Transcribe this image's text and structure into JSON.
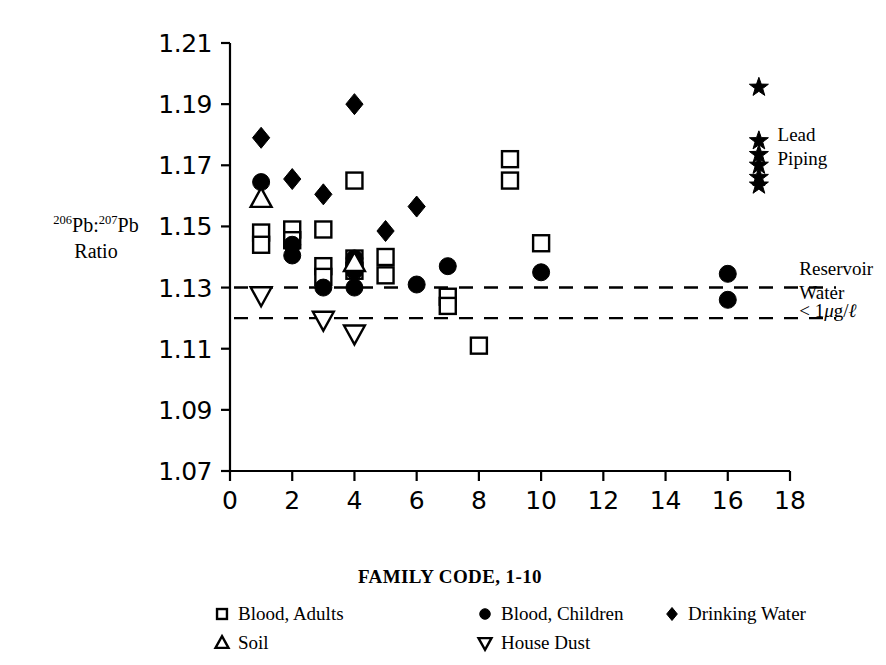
{
  "chart_data": {
    "type": "scatter",
    "title": "",
    "xlabel": "FAMILY CODE, 1-10",
    "ylabel": "206Pb:207Pb Ratio",
    "ylabel_parts": {
      "sup1": "206",
      "mid1": "Pb:",
      "sup2": "207",
      "mid2": "Pb",
      "line2": "Ratio"
    },
    "xlim": [
      0,
      18
    ],
    "ylim": [
      1.07,
      1.21
    ],
    "xticks": [
      0,
      2,
      4,
      6,
      8,
      10,
      12,
      14,
      16,
      18
    ],
    "xticklabels": [
      "0",
      "2",
      "4",
      "6",
      "8",
      "10",
      "12",
      "14",
      "16",
      "18"
    ],
    "yticks": [
      1.07,
      1.09,
      1.11,
      1.13,
      1.15,
      1.17,
      1.19,
      1.21
    ],
    "yticklabels": [
      "1.07",
      "1.09",
      "1.11",
      "1.13",
      "1.15",
      "1.17",
      "1.19",
      "1.21"
    ],
    "grid": false,
    "legend_position": "below-axes",
    "reference_lines": [
      {
        "name": "reservoir-water-upper",
        "y": 1.13,
        "style": "dashed"
      },
      {
        "name": "reservoir-water-lower",
        "y": 1.12,
        "style": "dashed"
      }
    ],
    "annotations": [
      {
        "name": "lead-piping",
        "text_lines": [
          "Lead",
          "Piping"
        ],
        "x": 17.6,
        "y": 1.178
      },
      {
        "name": "reservoir-water",
        "text_lines": [
          "Reservoir",
          "Water"
        ],
        "x": 18.3,
        "y": 1.134
      },
      {
        "name": "reservoir-water-conc",
        "text_lines": [
          "< 1ug/l"
        ],
        "x": 18.3,
        "y": 1.1205
      }
    ],
    "series": [
      {
        "name": "Blood, Adults",
        "marker": "open-square",
        "points": [
          {
            "x": 1,
            "y": 1.148
          },
          {
            "x": 1,
            "y": 1.144
          },
          {
            "x": 2,
            "y": 1.149
          },
          {
            "x": 2,
            "y": 1.1455
          },
          {
            "x": 3,
            "y": 1.149
          },
          {
            "x": 3,
            "y": 1.137
          },
          {
            "x": 3,
            "y": 1.1335
          },
          {
            "x": 4,
            "y": 1.165
          },
          {
            "x": 4,
            "y": 1.1395
          },
          {
            "x": 4,
            "y": 1.1355
          },
          {
            "x": 5,
            "y": 1.14
          },
          {
            "x": 5,
            "y": 1.134
          },
          {
            "x": 7,
            "y": 1.127
          },
          {
            "x": 7,
            "y": 1.124
          },
          {
            "x": 8,
            "y": 1.111
          },
          {
            "x": 9,
            "y": 1.172
          },
          {
            "x": 9,
            "y": 1.165
          },
          {
            "x": 10,
            "y": 1.1445
          }
        ]
      },
      {
        "name": "Blood, Children",
        "marker": "filled-circle",
        "points": [
          {
            "x": 1,
            "y": 1.1645
          },
          {
            "x": 2,
            "y": 1.144
          },
          {
            "x": 2,
            "y": 1.1405
          },
          {
            "x": 3,
            "y": 1.13
          },
          {
            "x": 4,
            "y": 1.1395
          },
          {
            "x": 4,
            "y": 1.1355
          },
          {
            "x": 4,
            "y": 1.13
          },
          {
            "x": 6,
            "y": 1.131
          },
          {
            "x": 7,
            "y": 1.137
          },
          {
            "x": 10,
            "y": 1.135
          },
          {
            "x": 16,
            "y": 1.1345
          },
          {
            "x": 16,
            "y": 1.126
          }
        ]
      },
      {
        "name": "Drinking Water",
        "marker": "filled-diamond",
        "points": [
          {
            "x": 1,
            "y": 1.179
          },
          {
            "x": 2,
            "y": 1.1655
          },
          {
            "x": 3,
            "y": 1.1605
          },
          {
            "x": 4,
            "y": 1.19
          },
          {
            "x": 5,
            "y": 1.1485
          },
          {
            "x": 6,
            "y": 1.1565
          }
        ]
      },
      {
        "name": "Soil",
        "marker": "open-triangle-up",
        "points": [
          {
            "x": 1,
            "y": 1.159
          },
          {
            "x": 4,
            "y": 1.138
          }
        ]
      },
      {
        "name": "House Dust",
        "marker": "open-triangle-down",
        "points": [
          {
            "x": 1,
            "y": 1.1275
          },
          {
            "x": 3,
            "y": 1.1195
          },
          {
            "x": 4,
            "y": 1.115
          }
        ]
      },
      {
        "name": "Lead Piping",
        "marker": "filled-star",
        "in_legend": false,
        "points": [
          {
            "x": 17,
            "y": 1.1955
          },
          {
            "x": 17,
            "y": 1.178
          },
          {
            "x": 17,
            "y": 1.1735
          },
          {
            "x": 17,
            "y": 1.17
          },
          {
            "x": 17,
            "y": 1.166
          },
          {
            "x": 17,
            "y": 1.1635
          }
        ]
      }
    ]
  },
  "legend": {
    "entries": [
      {
        "label": "Blood, Adults",
        "marker": "open-square",
        "col": 0,
        "row": 0
      },
      {
        "label": "Soil",
        "marker": "open-triangle-up",
        "col": 0,
        "row": 1
      },
      {
        "label": "Blood, Children",
        "marker": "filled-circle",
        "col": 1,
        "row": 0
      },
      {
        "label": "House Dust",
        "marker": "open-triangle-down",
        "col": 1,
        "row": 1
      },
      {
        "label": "Drinking Water",
        "marker": "filled-diamond",
        "col": 2,
        "row": 0
      }
    ]
  },
  "colors": {
    "foreground": "#000000",
    "background": "#ffffff"
  }
}
